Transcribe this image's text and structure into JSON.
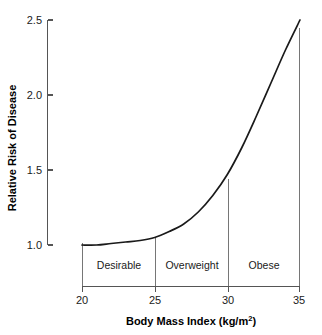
{
  "chart_data": {
    "type": "line",
    "title": "",
    "xlabel": "Body Mass Index (kg/m",
    "xlabel_sup": "2",
    "xlabel_tail": ")",
    "ylabel": "Relative Risk of Disease",
    "xlim": [
      20,
      35
    ],
    "ylim": [
      1.0,
      2.5
    ],
    "grid": false,
    "legend": "none",
    "x_ticks": [
      "20",
      "25",
      "30",
      "35"
    ],
    "x_tick_values": [
      20,
      25,
      30,
      35
    ],
    "y_ticks": [
      "1.0",
      "1.5",
      "2.0",
      "2.5"
    ],
    "y_tick_values": [
      1.0,
      1.5,
      2.0,
      2.5
    ],
    "series": [
      {
        "name": "Relative Risk of Disease",
        "color": "#1a1a1a",
        "x": [
          20,
          21,
          22,
          23,
          24,
          25,
          26,
          27,
          28,
          29,
          30,
          31,
          32,
          33,
          34,
          35
        ],
        "values": [
          1.0,
          1.0,
          1.01,
          1.02,
          1.03,
          1.05,
          1.09,
          1.14,
          1.22,
          1.33,
          1.47,
          1.65,
          1.86,
          2.08,
          2.3,
          2.5
        ]
      }
    ],
    "category_bands": [
      {
        "label": "Desirable",
        "x_start": 20,
        "x_end": 25,
        "top_value": 1.02
      },
      {
        "label": "Overweight",
        "x_start": 25,
        "x_end": 30,
        "top_value": 1.05
      },
      {
        "label": "Obese",
        "x_start": 30,
        "x_end": 35,
        "top_value": 1.47
      }
    ],
    "divider_values": [
      20,
      25,
      30,
      35
    ],
    "divider_tops": [
      1.02,
      1.05,
      1.47,
      2.43
    ],
    "axis_color": "#555555",
    "divider_color": "#767676",
    "background": "#ffffff"
  }
}
